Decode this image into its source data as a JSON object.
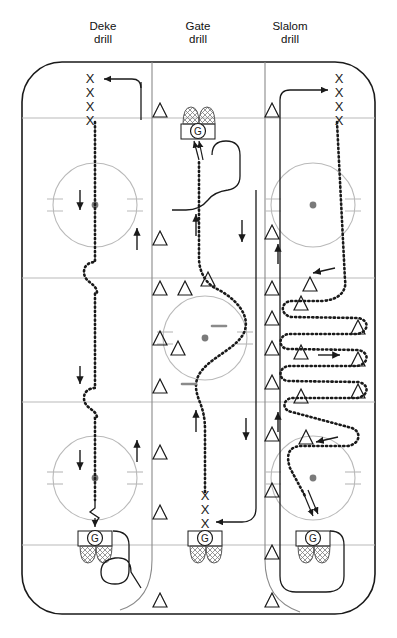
{
  "figure": {
    "type": "hockey-rink-drill-diagram",
    "width": 397,
    "height": 638
  },
  "titles": [
    {
      "id": "deke",
      "line1": "Deke",
      "line2": "drill",
      "x": 103,
      "y": 26
    },
    {
      "id": "gate",
      "line1": "Gate",
      "line2": "drill",
      "x": 198,
      "y": 26
    },
    {
      "id": "slalom",
      "line1": "Slalom",
      "line2": "drill",
      "x": 290,
      "y": 26
    }
  ],
  "rink": {
    "x": 22,
    "y": 62,
    "width": 353,
    "height": 552,
    "corner_radius": 40,
    "stroke": "#1a1a1a",
    "stroke_width": 1.6,
    "fill": "#ffffff",
    "line_color": "#b9b9b9",
    "horizontal_lines": [
      {
        "name": "top-goal-line",
        "y": 118
      },
      {
        "name": "top-blue-line",
        "y": 278
      },
      {
        "name": "bottom-blue-line",
        "y": 402
      },
      {
        "name": "bottom-goal-line",
        "y": 545
      }
    ],
    "vertical_lanes": [
      {
        "name": "lane-divider-left",
        "x": 152
      },
      {
        "name": "lane-divider-right",
        "x": 265
      }
    ],
    "lane_color": "#8a8a8a"
  },
  "faceoff_circles": [
    {
      "name": "top-left-circle",
      "cx": 95,
      "cy": 205,
      "r": 42,
      "dot": true
    },
    {
      "name": "top-right-circle",
      "cx": 313,
      "cy": 205,
      "r": 42,
      "dot": true
    },
    {
      "name": "center-circle",
      "cx": 205,
      "cy": 338,
      "r": 42,
      "dot": true
    },
    {
      "name": "bottom-left-circle",
      "cx": 95,
      "cy": 478,
      "r": 42,
      "dot": true
    },
    {
      "name": "bottom-right-circle",
      "cx": 313,
      "cy": 478,
      "r": 42,
      "dot": true
    }
  ],
  "goals": [
    {
      "name": "goal-top-center",
      "label": "G",
      "cx": 198,
      "cy": 131,
      "facing": "up"
    },
    {
      "name": "goal-bottom-left",
      "label": "G",
      "cx": 95,
      "cy": 538,
      "facing": "down"
    },
    {
      "name": "goal-bottom-center",
      "label": "G",
      "cx": 205,
      "cy": 538,
      "facing": "down"
    },
    {
      "name": "goal-bottom-right",
      "label": "G",
      "cx": 313,
      "cy": 538,
      "facing": "down"
    }
  ],
  "player_queues": [
    {
      "name": "queue-top-left",
      "marker": "X",
      "count": 4,
      "x": 90,
      "y_start": 78,
      "spacing": 14
    },
    {
      "name": "queue-top-right",
      "marker": "X",
      "count": 4,
      "x": 338,
      "y_start": 78,
      "spacing": 14
    },
    {
      "name": "queue-bottom-center",
      "marker": "X",
      "count": 4,
      "x": 205,
      "y_start": 492,
      "spacing": 14
    }
  ],
  "cones": {
    "marker": "triangle",
    "left_column_x": 160,
    "right_column_x": 272,
    "left_column_y": [
      110,
      238,
      288,
      338,
      386,
      452,
      512,
      600
    ],
    "right_column_y": [
      110,
      232,
      288,
      318,
      348,
      382,
      434,
      490,
      552,
      600
    ],
    "slalom_inner": [
      {
        "x": 301,
        "y": 303
      },
      {
        "x": 358,
        "y": 327
      },
      {
        "x": 301,
        "y": 352
      },
      {
        "x": 358,
        "y": 372
      },
      {
        "x": 301,
        "y": 396
      },
      {
        "x": 305,
        "y": 440
      },
      {
        "x": 310,
        "y": 285
      }
    ],
    "gate_extra": [
      {
        "x": 185,
        "y": 288
      },
      {
        "x": 205,
        "y": 279
      }
    ]
  },
  "paths": {
    "deke_skate": "dotted line down the left lane with two C-shaped deke loops",
    "gate_skate": "dotted line up the centre lane past gate cones",
    "slalom_skate": "dotted serpentine weaving between cones in the right lane",
    "return_lines": "solid lines returning players to the back of the queue"
  },
  "arrows": {
    "description": "small solid direction arrows along each lane",
    "items": [
      {
        "name": "arrow-deke-down-1",
        "x": 80,
        "y": 198,
        "dir": "down"
      },
      {
        "name": "arrow-return-up-1",
        "x": 136,
        "y": 232,
        "dir": "up"
      },
      {
        "name": "arrow-deke-down-2",
        "x": 80,
        "y": 375,
        "dir": "down"
      },
      {
        "name": "arrow-deke-down-3",
        "x": 80,
        "y": 458,
        "dir": "down"
      },
      {
        "name": "arrow-return-up-2",
        "x": 136,
        "y": 446,
        "dir": "up"
      },
      {
        "name": "arrow-gate-up-1",
        "x": 196,
        "y": 222,
        "dir": "up"
      },
      {
        "name": "arrow-gate-down-1",
        "x": 242,
        "y": 228,
        "dir": "down"
      },
      {
        "name": "arrow-gate-up-2",
        "x": 196,
        "y": 420,
        "dir": "up"
      },
      {
        "name": "arrow-gate-down-2",
        "x": 245,
        "y": 428,
        "dir": "down"
      },
      {
        "name": "arrow-slalom-up-1",
        "x": 278,
        "y": 252,
        "dir": "up"
      },
      {
        "name": "arrow-slalom-left-1",
        "x": 320,
        "y": 272,
        "dir": "left"
      },
      {
        "name": "arrow-slalom-right-1",
        "x": 332,
        "y": 355,
        "dir": "right"
      },
      {
        "name": "arrow-slalom-up-2",
        "x": 278,
        "y": 418,
        "dir": "up"
      },
      {
        "name": "arrow-slalom-left-2",
        "x": 322,
        "y": 440,
        "dir": "left"
      }
    ]
  },
  "colors": {
    "ink": "#1a1a1a",
    "rink_line": "#b9b9b9",
    "lane_line": "#8a8a8a",
    "dot": "#6f6f6f",
    "net_mesh": "#6f6f6f"
  }
}
